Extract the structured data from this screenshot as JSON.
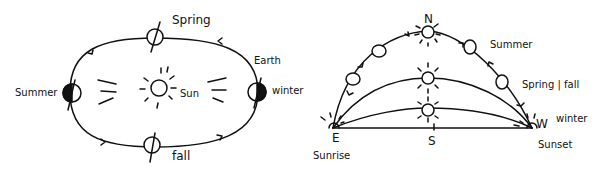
{
  "orbit_diagram": {
    "labels": {
      "spring": "Spring",
      "summer": "Summer",
      "winter": "winter",
      "fall": "fall",
      "earth": "Earth",
      "sun": "Sun"
    }
  },
  "sky_path_diagram": {
    "labels": {
      "north": "N",
      "east": "E",
      "south": "S",
      "west": "W",
      "sunrise": "Sunrise",
      "sunset": "Sunset",
      "summer": "Summer",
      "spring_fall": "Spring | fall",
      "winter": "winter"
    }
  },
  "colors": {
    "ink": "#111111",
    "background": "#ffffff"
  }
}
